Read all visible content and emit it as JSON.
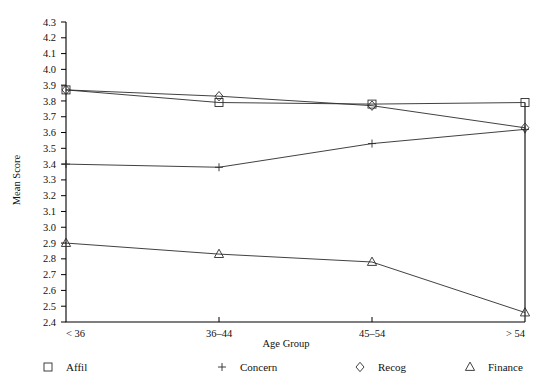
{
  "chart_data": {
    "type": "line",
    "title": "",
    "xlabel": "Age Group",
    "ylabel": "Mean Score",
    "categories": [
      "< 36",
      "36–44",
      "45–54",
      "> 54"
    ],
    "ylim": [
      2.4,
      4.3
    ],
    "ytick_step": 0.1,
    "yticks": [
      "4.3",
      "4.2",
      "4.1",
      "4.0",
      "3.9",
      "3.8",
      "3.7",
      "3.6",
      "3.5",
      "3.4",
      "3.3",
      "3.2",
      "3.1",
      "3.0",
      "2.9",
      "2.8",
      "2.7",
      "2.6",
      "2.5",
      "2.4"
    ],
    "grid": false,
    "legend_position": "bottom",
    "series": [
      {
        "name": "Affil",
        "marker": "square",
        "values": [
          3.87,
          3.79,
          3.78,
          3.79
        ]
      },
      {
        "name": "Concern",
        "marker": "plus",
        "values": [
          3.4,
          3.38,
          3.53,
          3.62
        ]
      },
      {
        "name": "Recog",
        "marker": "diamond",
        "values": [
          3.87,
          3.83,
          3.77,
          3.63
        ]
      },
      {
        "name": "Finance",
        "marker": "triangle",
        "values": [
          2.9,
          2.83,
          2.78,
          2.46
        ]
      }
    ]
  },
  "legend": {
    "items": [
      {
        "label": "Affil",
        "marker": "square"
      },
      {
        "label": "Concern",
        "marker": "plus"
      },
      {
        "label": "Recog",
        "marker": "diamond"
      },
      {
        "label": "Finance",
        "marker": "triangle"
      }
    ]
  },
  "colors": {
    "axis": "#000000",
    "series": "#2b2b2b",
    "background": "#ffffff"
  }
}
